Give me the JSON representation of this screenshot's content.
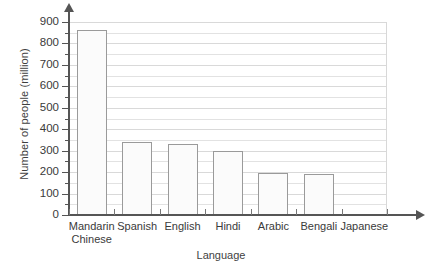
{
  "chart_data": {
    "type": "bar",
    "title": "",
    "xlabel": "Language",
    "ylabel": "Number of people (million)",
    "categories": [
      "Mandarin Chinese",
      "Spanish",
      "English",
      "Hindi",
      "Arabic",
      "Bengali",
      "Japanese"
    ],
    "category_lines": [
      [
        "Mandarin",
        "Chinese"
      ],
      [
        "Spanish"
      ],
      [
        "English"
      ],
      [
        "Hindi"
      ],
      [
        "Arabic"
      ],
      [
        "Bengali"
      ],
      [
        "Japanese"
      ]
    ],
    "values": [
      865,
      340,
      330,
      300,
      195,
      190,
      null
    ],
    "ylim": [
      0,
      900
    ],
    "ytick_labels": [
      "0",
      "100",
      "200",
      "300",
      "400",
      "500",
      "600",
      "700",
      "800",
      "900"
    ],
    "ytick_values": [
      0,
      100,
      200,
      300,
      400,
      500,
      600,
      700,
      800,
      900
    ],
    "yminor_values": [
      50,
      150,
      250,
      350,
      450,
      550,
      650,
      750,
      850
    ],
    "grid": true,
    "grid_interval": 50,
    "legend": "none",
    "bar_fill": "#fbfbfb",
    "bar_edge": "#9a9a9a",
    "axis_color": "#555555",
    "grid_color": "#e2e2e2"
  }
}
